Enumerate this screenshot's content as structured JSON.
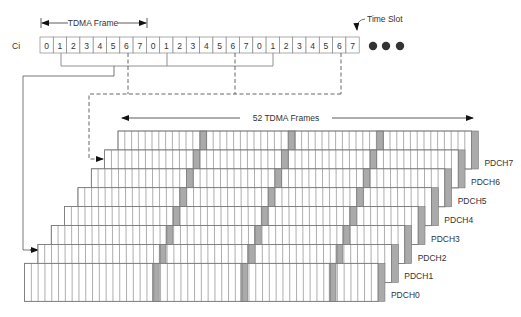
{
  "top_strip": {
    "row_label": "Ci",
    "slots": [
      "0",
      "1",
      "2",
      "3",
      "4",
      "5",
      "6",
      "7",
      "0",
      "1",
      "2",
      "3",
      "4",
      "5",
      "6",
      "7",
      "0",
      "1",
      "2",
      "3",
      "4",
      "5",
      "6",
      "7"
    ],
    "tdma_frame_label": "TDMA Frame",
    "time_slot_label": "Time Slot",
    "continuation": "●●●"
  },
  "multiframe": {
    "label": "52 TDMA Frames",
    "frames": 52,
    "channels": [
      "PDCH0",
      "PDCH1",
      "PDCH2",
      "PDCH3",
      "PDCH4",
      "PDCH5",
      "PDCH6",
      "PDCH7"
    ]
  },
  "colors": {
    "line": "#777777",
    "highlight": "#aaaaaa",
    "text": "#333333"
  }
}
